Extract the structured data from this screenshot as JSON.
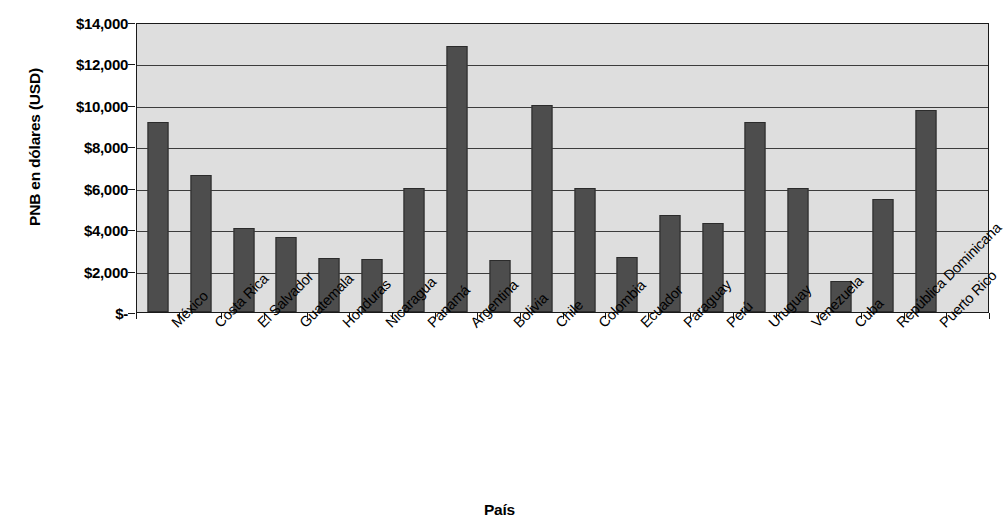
{
  "chart_data": {
    "type": "bar",
    "title": "",
    "xlabel": "País",
    "ylabel": "PNB en dólares (USD)",
    "categories": [
      "México",
      "Costa Rica",
      "El Salvador",
      "Guatemala",
      "Honduras",
      "Nicaragua",
      "Panamá",
      "Argentina",
      "Bolivia",
      "Chile",
      "Colombia",
      "Ecuador",
      "Paraguay",
      "Perú",
      "Uruguay",
      "Venezuela",
      "Cuba",
      "República Dominicana",
      "Puerto Rico"
    ],
    "values": [
      9150,
      6600,
      4050,
      3620,
      2620,
      2570,
      5980,
      12850,
      2500,
      10000,
      6000,
      2680,
      4700,
      4320,
      9180,
      5980,
      1520,
      5450,
      9750
    ],
    "ylim": [
      0,
      14000
    ],
    "ytick_values": [
      0,
      2000,
      4000,
      6000,
      8000,
      10000,
      12000,
      14000
    ],
    "ytick_labels": [
      "$-",
      "$2,000",
      "$4,000",
      "$6,000",
      "$8,000",
      "$10,000",
      "$12,000",
      "$14,000"
    ],
    "grid": true,
    "legend": "none",
    "bar_color": "#4d4d4d",
    "plot_background": "#dedede",
    "axis_color": "#1a1a1a",
    "gridline_color": "#3c3c3c",
    "xtick_rotation": -45,
    "slot_count": 20
  }
}
